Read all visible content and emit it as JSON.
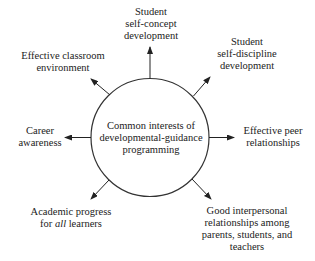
{
  "diagram": {
    "title": "Common interests of developmental-guidance programming",
    "colors": {
      "ink": "#222222",
      "background": "#ffffff"
    },
    "center": {
      "shape": "circle",
      "lines": [
        "Common interests of",
        "developmental-guidance",
        "programming"
      ]
    },
    "nodes": [
      {
        "id": "self-concept",
        "direction": "up",
        "lines": [
          "Student",
          "self-concept",
          "development"
        ]
      },
      {
        "id": "self-discipline",
        "direction": "up-right",
        "lines": [
          "Student",
          "self-discipline",
          "development"
        ]
      },
      {
        "id": "peer",
        "direction": "right",
        "lines": [
          "Effective peer",
          "relationships"
        ]
      },
      {
        "id": "interpersonal",
        "direction": "down-right",
        "lines": [
          "Good interpersonal",
          "relationships among",
          "parents, students, and",
          "teachers"
        ]
      },
      {
        "id": "academic",
        "direction": "down-left",
        "lines": [
          "Academic progress",
          "for ",
          "all",
          " learners"
        ]
      },
      {
        "id": "career",
        "direction": "left",
        "lines": [
          "Career",
          "awareness"
        ]
      },
      {
        "id": "classroom",
        "direction": "up-left",
        "lines": [
          "Effective classroom",
          "environment"
        ]
      }
    ],
    "edges": [
      {
        "from": "center",
        "to": "self-concept"
      },
      {
        "from": "center",
        "to": "self-discipline"
      },
      {
        "from": "center",
        "to": "peer"
      },
      {
        "from": "center",
        "to": "interpersonal"
      },
      {
        "from": "center",
        "to": "academic"
      },
      {
        "from": "center",
        "to": "career"
      },
      {
        "from": "center",
        "to": "classroom"
      }
    ]
  }
}
